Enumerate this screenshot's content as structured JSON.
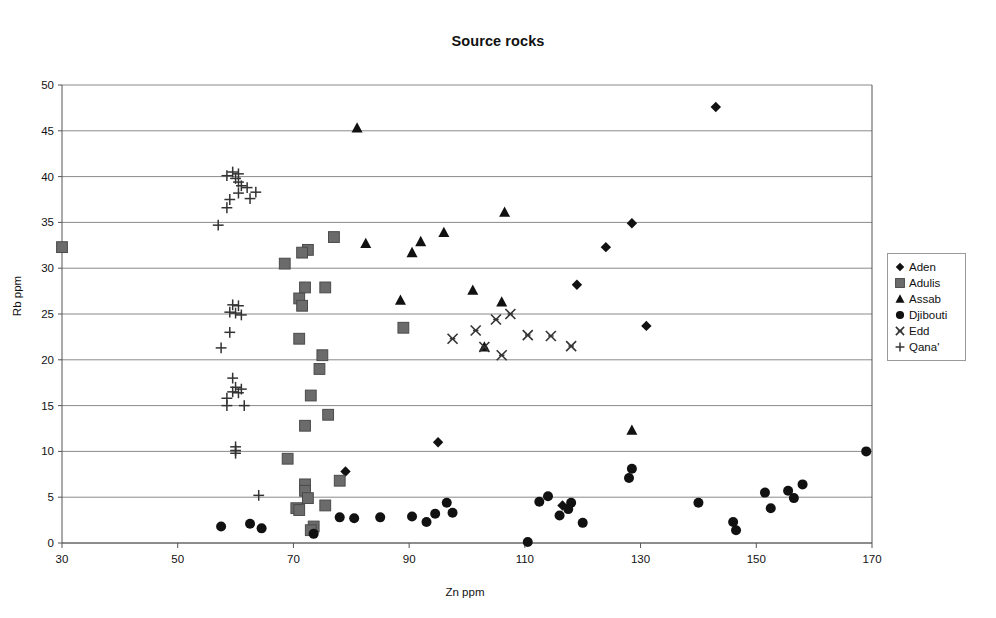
{
  "chart_data": {
    "type": "scatter",
    "title": "Source rocks",
    "xlabel": "Zn ppm",
    "ylabel": "Rb ppm",
    "xlim": [
      30,
      170
    ],
    "ylim": [
      0,
      50
    ],
    "xticks": [
      30,
      50,
      70,
      90,
      110,
      130,
      150,
      170
    ],
    "yticks": [
      0,
      5,
      10,
      15,
      20,
      25,
      30,
      35,
      40,
      45,
      50
    ],
    "grid": "horizontal",
    "legend_position": "right",
    "series": [
      {
        "name": "Aden",
        "marker": "diamond",
        "color": "#111111",
        "points": [
          [
            143.0,
            47.6
          ],
          [
            128.5,
            34.9
          ],
          [
            124.0,
            32.3
          ],
          [
            131.0,
            23.7
          ],
          [
            119.0,
            28.2
          ],
          [
            95.0,
            11.0
          ],
          [
            79.0,
            7.8
          ],
          [
            116.5,
            4.1
          ]
        ]
      },
      {
        "name": "Adulis",
        "marker": "square",
        "color": "#6b6b6b",
        "points": [
          [
            30.0,
            32.3
          ],
          [
            77.0,
            33.4
          ],
          [
            72.5,
            32.0
          ],
          [
            71.5,
            31.7
          ],
          [
            68.5,
            30.5
          ],
          [
            72.0,
            27.9
          ],
          [
            75.5,
            27.9
          ],
          [
            71.0,
            26.7
          ],
          [
            71.5,
            25.9
          ],
          [
            89.0,
            23.5
          ],
          [
            71.0,
            22.3
          ],
          [
            75.0,
            20.5
          ],
          [
            74.5,
            19.0
          ],
          [
            73.0,
            16.1
          ],
          [
            76.0,
            14.0
          ],
          [
            72.0,
            12.8
          ],
          [
            69.0,
            9.2
          ],
          [
            78.0,
            6.8
          ],
          [
            72.0,
            6.4
          ],
          [
            72.0,
            5.7
          ],
          [
            72.5,
            4.9
          ],
          [
            75.5,
            4.1
          ],
          [
            70.5,
            3.8
          ],
          [
            71.0,
            3.6
          ],
          [
            73.5,
            1.8
          ],
          [
            73.0,
            1.4
          ]
        ]
      },
      {
        "name": "Assab",
        "marker": "triangle",
        "color": "#111111",
        "points": [
          [
            81.0,
            45.3
          ],
          [
            96.0,
            33.9
          ],
          [
            92.0,
            32.9
          ],
          [
            82.5,
            32.7
          ],
          [
            90.5,
            31.7
          ],
          [
            106.5,
            36.1
          ],
          [
            101.0,
            27.6
          ],
          [
            106.0,
            26.3
          ],
          [
            88.5,
            26.5
          ],
          [
            103.0,
            21.4
          ],
          [
            128.5,
            12.3
          ]
        ]
      },
      {
        "name": "Djibouti",
        "marker": "circle",
        "color": "#111111",
        "points": [
          [
            169.0,
            10.0
          ],
          [
            128.5,
            8.1
          ],
          [
            128.0,
            7.1
          ],
          [
            158.0,
            6.4
          ],
          [
            151.5,
            5.5
          ],
          [
            155.5,
            5.7
          ],
          [
            156.5,
            4.9
          ],
          [
            114.0,
            5.1
          ],
          [
            118.0,
            4.4
          ],
          [
            117.5,
            3.7
          ],
          [
            140.0,
            4.4
          ],
          [
            152.5,
            3.8
          ],
          [
            112.5,
            4.5
          ],
          [
            116.0,
            3.0
          ],
          [
            120.0,
            2.2
          ],
          [
            146.0,
            2.3
          ],
          [
            146.5,
            1.4
          ],
          [
            96.5,
            4.4
          ],
          [
            94.5,
            3.2
          ],
          [
            97.5,
            3.3
          ],
          [
            90.5,
            2.9
          ],
          [
            93.0,
            2.3
          ],
          [
            85.0,
            2.8
          ],
          [
            80.5,
            2.7
          ],
          [
            78.0,
            2.8
          ],
          [
            62.5,
            2.1
          ],
          [
            57.5,
            1.8
          ],
          [
            64.5,
            1.6
          ],
          [
            73.5,
            1.0
          ],
          [
            110.5,
            0.1
          ]
        ]
      },
      {
        "name": "Edd",
        "marker": "cross",
        "color": "#333333",
        "points": [
          [
            105.0,
            24.4
          ],
          [
            107.5,
            25.0
          ],
          [
            101.5,
            23.2
          ],
          [
            110.5,
            22.7
          ],
          [
            114.5,
            22.6
          ],
          [
            118.0,
            21.5
          ],
          [
            97.5,
            22.3
          ],
          [
            103.0,
            21.4
          ],
          [
            106.0,
            20.5
          ]
        ]
      },
      {
        "name": "Qana'",
        "marker": "plus",
        "color": "#333333",
        "points": [
          [
            59.5,
            40.5
          ],
          [
            60.5,
            40.3
          ],
          [
            58.5,
            40.1
          ],
          [
            60.0,
            39.8
          ],
          [
            60.5,
            39.4
          ],
          [
            61.0,
            39.0
          ],
          [
            62.0,
            38.8
          ],
          [
            63.5,
            38.3
          ],
          [
            60.5,
            38.2
          ],
          [
            62.5,
            37.6
          ],
          [
            59.0,
            37.5
          ],
          [
            58.5,
            36.6
          ],
          [
            57.0,
            34.7
          ],
          [
            59.5,
            26.0
          ],
          [
            60.5,
            25.9
          ],
          [
            59.0,
            25.2
          ],
          [
            60.0,
            25.1
          ],
          [
            61.0,
            24.9
          ],
          [
            59.0,
            23.0
          ],
          [
            57.5,
            21.3
          ],
          [
            59.5,
            18.0
          ],
          [
            60.0,
            17.0
          ],
          [
            59.5,
            16.5
          ],
          [
            60.5,
            16.4
          ],
          [
            58.5,
            15.8
          ],
          [
            61.0,
            16.8
          ],
          [
            58.5,
            15.0
          ],
          [
            61.5,
            15.0
          ],
          [
            60.0,
            10.5
          ],
          [
            60.0,
            10.1
          ],
          [
            60.0,
            9.8
          ],
          [
            64.0,
            5.2
          ]
        ]
      }
    ]
  },
  "legend": {
    "items": [
      {
        "label": "Aden",
        "marker": "diamond"
      },
      {
        "label": "Adulis",
        "marker": "square"
      },
      {
        "label": "Assab",
        "marker": "triangle"
      },
      {
        "label": "Djibouti",
        "marker": "circle"
      },
      {
        "label": "Edd",
        "marker": "cross"
      },
      {
        "label": "Qana'",
        "marker": "plus"
      }
    ]
  },
  "colors": {
    "axis": "#555555",
    "grid": "#8a8a8a",
    "text": "#111111",
    "adulis_fill": "#6b6b6b",
    "marker_dark": "#111111"
  }
}
